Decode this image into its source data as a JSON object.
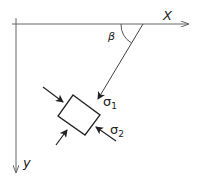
{
  "diagram": {
    "type": "stress-element-sketch",
    "axes": {
      "x_label": "X",
      "y_label": "y"
    },
    "angle_label": "β",
    "stress_labels": {
      "sigma1": "σ",
      "sigma1_sub": "1",
      "sigma2": "σ",
      "sigma2_sub": "2"
    },
    "colors": {
      "stroke": "#222222",
      "axis": "#666666",
      "background": "#ffffff"
    }
  }
}
